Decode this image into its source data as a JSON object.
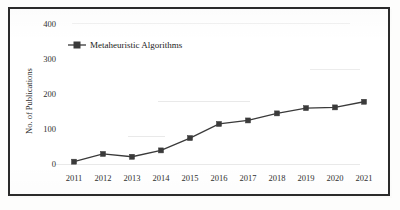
{
  "figure": {
    "border_color": "#2b2b2b",
    "background_color": "#ffffff"
  },
  "legend": {
    "entries": [
      {
        "label": "Metaheuristic Algorithms",
        "marker": "square-marker",
        "color": "#3a3a3a"
      }
    ],
    "position": "top-left-inside"
  },
  "axes": {
    "y_title": "No. of Publications",
    "y_ticks": [
      "0",
      "100",
      "200",
      "300",
      "400"
    ],
    "x_ticks": [
      "2011",
      "2012",
      "2013",
      "2014",
      "2015",
      "2016",
      "2017",
      "2018",
      "2019",
      "2020",
      "2021"
    ]
  },
  "chart_data": {
    "type": "line",
    "title": "",
    "subtitle": "",
    "xlabel": "",
    "ylabel": "No. of Publications",
    "categories": [
      "2011",
      "2012",
      "2013",
      "2014",
      "2015",
      "2016",
      "2017",
      "2018",
      "2019",
      "2020",
      "2021"
    ],
    "x": [
      2011,
      2012,
      2013,
      2014,
      2015,
      2016,
      2017,
      2018,
      2019,
      2020,
      2021
    ],
    "series": [
      {
        "name": "Metaheuristic Algorithms",
        "color": "#3a3a3a",
        "marker": "square",
        "values": [
          8,
          30,
          22,
          40,
          75,
          115,
          125,
          145,
          160,
          162,
          178
        ]
      }
    ],
    "ylim": [
      0,
      400
    ],
    "yticks": [
      0,
      100,
      200,
      300,
      400
    ],
    "grid": false,
    "legend": "top-left"
  }
}
